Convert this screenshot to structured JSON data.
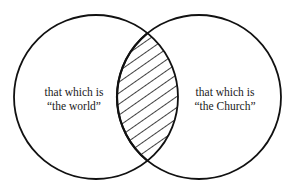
{
  "diagram": {
    "type": "venn",
    "colors": {
      "stroke": "#111111",
      "background": "#ffffff",
      "hatch": "#111111"
    },
    "sets": [
      {
        "id": "world",
        "line1": "that which is",
        "line2": "“the world”"
      },
      {
        "id": "church",
        "line1": "that which is",
        "line2": "“the Church”"
      }
    ],
    "intersection": {
      "fill": "diagonal-hatch"
    }
  }
}
